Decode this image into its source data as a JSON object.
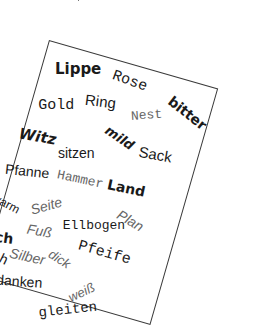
{
  "image": {
    "description": "Rotated white card with a border containing scattered German words in varied fonts, weights, sizes and orientations"
  },
  "card": {
    "border_color": "#3a3a3a",
    "background": "#ffffff",
    "rotation_deg": 16,
    "words": [
      {
        "text": "Lippe",
        "style": "bold-sans"
      },
      {
        "text": "Rose",
        "style": "mono"
      },
      {
        "text": "bitter",
        "style": "bold-sans"
      },
      {
        "text": "Ring",
        "style": "sans"
      },
      {
        "text": "Nest",
        "style": "mono-light"
      },
      {
        "text": "Gold",
        "style": "mono"
      },
      {
        "text": "mild",
        "style": "bold-sans"
      },
      {
        "text": "Sack",
        "style": "sans"
      },
      {
        "text": "Witz",
        "style": "bold-sans"
      },
      {
        "text": "sitzen",
        "style": "sans"
      },
      {
        "text": "Land",
        "style": "bold-sans"
      },
      {
        "text": "Pfanne",
        "style": "sans"
      },
      {
        "text": "Hammer",
        "style": "mono-light"
      },
      {
        "text": "Plan",
        "style": "sans-italic-light"
      },
      {
        "text": "Seite",
        "style": "sans-italic-light"
      },
      {
        "text": "Ellbogen",
        "style": "mono"
      },
      {
        "text": "warm",
        "style": "sans"
      },
      {
        "text": "Fuß",
        "style": "sans-italic-light"
      },
      {
        "text": "Pfeife",
        "style": "mono"
      },
      {
        "text": "dick",
        "style": "sans-italic-light"
      },
      {
        "text": "Milch",
        "style": "bold-sans"
      },
      {
        "text": "Silber",
        "style": "sans-italic-light"
      },
      {
        "text": "weiß",
        "style": "sans-italic-light"
      },
      {
        "text": "Storch",
        "style": "mono"
      },
      {
        "text": "danken",
        "style": "sans"
      },
      {
        "text": "gleiten",
        "style": "mono"
      }
    ]
  }
}
